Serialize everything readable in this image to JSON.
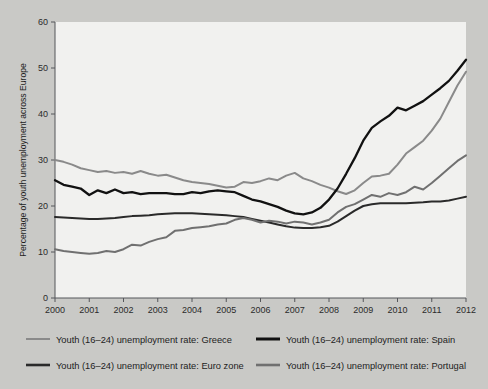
{
  "figure": {
    "background_color": "#c9c9c6",
    "plot_background_color": "#f1f1ef",
    "axis_color": "#55565a"
  },
  "chart_data": {
    "type": "line",
    "title": "",
    "xlabel": "",
    "ylabel": "Percentage of youth unemployment across Europe",
    "xlim": [
      2000,
      2012
    ],
    "ylim": [
      0,
      60
    ],
    "ytick_labels": [
      "0",
      "10",
      "20",
      "30",
      "40",
      "50",
      "60"
    ],
    "yticks": [
      0,
      10,
      20,
      30,
      40,
      50,
      60
    ],
    "xtick_labels": [
      "2000",
      "2001",
      "2002",
      "2003",
      "2004",
      "2005",
      "2006",
      "2007",
      "2008",
      "2009",
      "2010",
      "2011",
      "2012"
    ],
    "xticks": [
      2000,
      2001,
      2002,
      2003,
      2004,
      2005,
      2006,
      2007,
      2008,
      2009,
      2010,
      2011,
      2012
    ],
    "grid": false,
    "legend_position": "below",
    "series": [
      {
        "name": "Youth (16–24) unemployment rate: Greece",
        "color": "#8a8a8a",
        "width": 2.0,
        "x": [
          2000.0,
          2000.25,
          2000.5,
          2000.75,
          2001.0,
          2001.25,
          2001.5,
          2001.75,
          2002.0,
          2002.25,
          2002.5,
          2002.75,
          2003.0,
          2003.25,
          2003.5,
          2003.75,
          2004.0,
          2004.25,
          2004.5,
          2004.75,
          2005.0,
          2005.25,
          2005.5,
          2005.75,
          2006.0,
          2006.25,
          2006.5,
          2006.75,
          2007.0,
          2007.25,
          2007.5,
          2007.75,
          2008.0,
          2008.25,
          2008.5,
          2008.75,
          2009.0,
          2009.25,
          2009.5,
          2009.75,
          2010.0,
          2010.25,
          2010.5,
          2010.75,
          2011.0,
          2011.25,
          2011.5,
          2011.75,
          2012.0
        ],
        "values": [
          30.0,
          29.6,
          29.0,
          28.2,
          27.8,
          27.4,
          27.6,
          27.2,
          27.4,
          27.0,
          27.6,
          27.0,
          26.6,
          26.8,
          26.2,
          25.6,
          25.2,
          25.0,
          24.8,
          24.4,
          24.0,
          24.2,
          25.2,
          25.0,
          25.4,
          26.0,
          25.6,
          26.6,
          27.2,
          26.0,
          25.4,
          24.6,
          24.0,
          23.2,
          22.6,
          23.4,
          25.0,
          26.4,
          26.6,
          27.0,
          29.0,
          31.4,
          32.8,
          34.2,
          36.4,
          39.0,
          42.6,
          46.2,
          49.2
        ]
      },
      {
        "name": "Youth (16–24) unemployment rate: Spain",
        "color": "#111111",
        "width": 2.3,
        "x": [
          2000.0,
          2000.25,
          2000.5,
          2000.75,
          2001.0,
          2001.25,
          2001.5,
          2001.75,
          2002.0,
          2002.25,
          2002.5,
          2002.75,
          2003.0,
          2003.25,
          2003.5,
          2003.75,
          2004.0,
          2004.25,
          2004.5,
          2004.75,
          2005.0,
          2005.25,
          2005.5,
          2005.75,
          2006.0,
          2006.25,
          2006.5,
          2006.75,
          2007.0,
          2007.25,
          2007.5,
          2007.75,
          2008.0,
          2008.25,
          2008.5,
          2008.75,
          2009.0,
          2009.25,
          2009.5,
          2009.75,
          2010.0,
          2010.25,
          2010.5,
          2010.75,
          2011.0,
          2011.25,
          2011.5,
          2011.75,
          2012.0
        ],
        "values": [
          25.6,
          24.6,
          24.2,
          23.8,
          22.4,
          23.4,
          22.8,
          23.6,
          22.8,
          23.0,
          22.6,
          22.8,
          22.8,
          22.8,
          22.6,
          22.6,
          23.0,
          22.8,
          23.2,
          23.4,
          23.2,
          23.0,
          22.2,
          21.4,
          21.0,
          20.4,
          19.8,
          19.0,
          18.4,
          18.2,
          18.6,
          19.6,
          21.4,
          23.8,
          27.0,
          30.4,
          34.2,
          37.0,
          38.4,
          39.6,
          41.4,
          40.8,
          41.8,
          42.8,
          44.2,
          45.6,
          47.2,
          49.4,
          51.8
        ]
      },
      {
        "name": "Youth (16–24) unemployment rate: Euro zone",
        "color": "#2a2a2a",
        "width": 2.0,
        "x": [
          2000.0,
          2000.25,
          2000.5,
          2000.75,
          2001.0,
          2001.25,
          2001.5,
          2001.75,
          2002.0,
          2002.25,
          2002.5,
          2002.75,
          2003.0,
          2003.25,
          2003.5,
          2003.75,
          2004.0,
          2004.25,
          2004.5,
          2004.75,
          2005.0,
          2005.25,
          2005.5,
          2005.75,
          2006.0,
          2006.25,
          2006.5,
          2006.75,
          2007.0,
          2007.25,
          2007.5,
          2007.75,
          2008.0,
          2008.25,
          2008.5,
          2008.75,
          2009.0,
          2009.25,
          2009.5,
          2009.75,
          2010.0,
          2010.25,
          2010.5,
          2010.75,
          2011.0,
          2011.25,
          2011.5,
          2011.75,
          2012.0
        ],
        "values": [
          17.6,
          17.5,
          17.4,
          17.3,
          17.2,
          17.2,
          17.3,
          17.4,
          17.6,
          17.8,
          17.9,
          18.0,
          18.2,
          18.3,
          18.4,
          18.4,
          18.4,
          18.3,
          18.2,
          18.1,
          18.0,
          17.8,
          17.6,
          17.2,
          16.8,
          16.4,
          16.0,
          15.6,
          15.3,
          15.2,
          15.2,
          15.4,
          15.7,
          16.6,
          17.8,
          19.0,
          20.0,
          20.4,
          20.6,
          20.6,
          20.6,
          20.6,
          20.7,
          20.8,
          21.0,
          21.0,
          21.2,
          21.6,
          22.0
        ]
      },
      {
        "name": "Youth (16–24) unemployment rate: Portugal",
        "color": "#707070",
        "width": 2.0,
        "x": [
          2000.0,
          2000.25,
          2000.5,
          2000.75,
          2001.0,
          2001.25,
          2001.5,
          2001.75,
          2002.0,
          2002.25,
          2002.5,
          2002.75,
          2003.0,
          2003.25,
          2003.5,
          2003.75,
          2004.0,
          2004.25,
          2004.5,
          2004.75,
          2005.0,
          2005.25,
          2005.5,
          2005.75,
          2006.0,
          2006.25,
          2006.5,
          2006.75,
          2007.0,
          2007.25,
          2007.5,
          2007.75,
          2008.0,
          2008.25,
          2008.5,
          2008.75,
          2009.0,
          2009.25,
          2009.5,
          2009.75,
          2010.0,
          2010.25,
          2010.5,
          2010.75,
          2011.0,
          2011.25,
          2011.5,
          2011.75,
          2012.0
        ],
        "values": [
          10.6,
          10.2,
          10.0,
          9.8,
          9.6,
          9.8,
          10.2,
          10.0,
          10.6,
          11.6,
          11.4,
          12.2,
          12.8,
          13.2,
          14.6,
          14.8,
          15.2,
          15.4,
          15.6,
          16.0,
          16.2,
          17.0,
          17.4,
          17.0,
          16.4,
          16.8,
          16.6,
          16.2,
          16.6,
          16.4,
          16.0,
          16.4,
          17.0,
          18.6,
          19.8,
          20.4,
          21.4,
          22.4,
          22.0,
          22.8,
          22.4,
          23.0,
          24.2,
          23.6,
          25.0,
          26.6,
          28.2,
          29.8,
          31.0
        ]
      }
    ]
  },
  "legend": {
    "items": [
      {
        "label": "Youth (16–24) unemployment rate: Greece",
        "color": "#8a8a8a",
        "width": 2.0
      },
      {
        "label": "Youth (16–24) unemployment rate: Spain",
        "color": "#111111",
        "width": 3.0
      },
      {
        "label": "Youth (16–24) unemployment rate: Euro zone",
        "color": "#2a2a2a",
        "width": 2.6
      },
      {
        "label": "Youth (16–24) unemployment rate: Portugal",
        "color": "#707070",
        "width": 2.6
      }
    ]
  }
}
